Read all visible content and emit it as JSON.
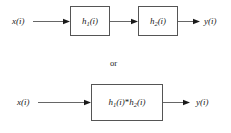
{
  "figure": {
    "type": "block-diagram",
    "background_color": "#ffffff",
    "line_color": "#555555",
    "text_color": "#1a1a1a"
  },
  "connector": {
    "alternative_text": "or"
  },
  "top_diagram": {
    "input_label": "x(i)",
    "output_label": "y(i)",
    "blocks": [
      {
        "label_main": "h",
        "label_sub": "1",
        "label_tail": "(i)",
        "full": "h1(i)"
      },
      {
        "label_main": "h",
        "label_sub": "2",
        "label_tail": "(i)",
        "full": "h2(i)"
      }
    ]
  },
  "bottom_diagram": {
    "input_label": "x(i)",
    "output_label": "y(i)",
    "blocks": [
      {
        "label_main": "h",
        "label_sub": "1",
        "label_mid": "(i)",
        "operator": "*",
        "label_main2": "h",
        "label_sub2": "2",
        "label_tail2": "(i)",
        "full": "h1(i)*h2(i)"
      }
    ]
  }
}
